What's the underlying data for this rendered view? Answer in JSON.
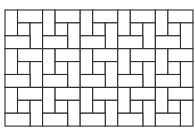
{
  "diagram": {
    "type": "pinwheel-tiling",
    "origin": {
      "x": 5,
      "y": 10
    },
    "unit": {
      "w": 12.53,
      "h": 12.9
    },
    "cells_x": 5,
    "cells_y": 3,
    "cell_units": 3,
    "line_color": "#2b2b2b",
    "fill_color": "#ffffff",
    "cell_pattern": [
      {
        "kind": "vertical-brick",
        "col": 0,
        "row": 0,
        "w": 1,
        "h": 2
      },
      {
        "kind": "horizontal-brick",
        "col": 1,
        "row": 0,
        "w": 2,
        "h": 1
      },
      {
        "kind": "square",
        "col": 1,
        "row": 1,
        "w": 1,
        "h": 1
      },
      {
        "kind": "vertical-brick",
        "col": 2,
        "row": 1,
        "w": 1,
        "h": 2
      },
      {
        "kind": "horizontal-brick",
        "col": 0,
        "row": 2,
        "w": 2,
        "h": 1
      }
    ]
  }
}
